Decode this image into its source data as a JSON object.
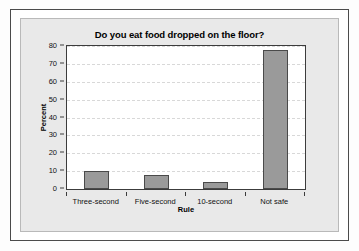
{
  "chart_data": {
    "type": "bar",
    "title": "Do you eat food dropped on the floor?",
    "xlabel": "Rule",
    "ylabel": "Percent",
    "categories": [
      "Three-second",
      "Five-second",
      "10-second",
      "Not safe"
    ],
    "values": [
      10,
      8,
      4,
      77.5
    ],
    "ylim": [
      0,
      80
    ],
    "yticks": [
      0,
      10,
      20,
      30,
      40,
      50,
      60,
      70,
      80
    ],
    "ytick_labels": [
      "0",
      "10",
      "20",
      "30",
      "40",
      "50",
      "60",
      "70",
      "80"
    ],
    "grid": true,
    "legend": false,
    "bar_color": "#9a9a9a",
    "bar_edge_color": "#4a4a4a",
    "panel_color": "#e9e9e9",
    "plot_background": "#ffffff",
    "frame_color": "#4b4b4b",
    "gridline_color": "#d8d8d8"
  }
}
